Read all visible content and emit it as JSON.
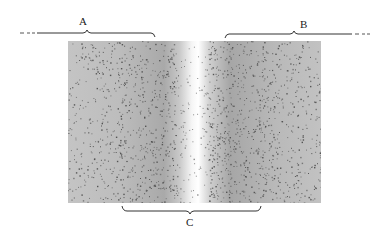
{
  "figure": {
    "labels": {
      "a": "A",
      "b": "B",
      "c": "C"
    },
    "regions": [
      {
        "id": "a",
        "label": "A",
        "description": "left region (dashed extension to the left)"
      },
      {
        "id": "b",
        "label": "B",
        "description": "right region (dashed extension to the right)"
      },
      {
        "id": "c",
        "label": "C",
        "description": "central region spanning the bright band"
      }
    ],
    "colors": {
      "background_fill": "#b4b4b4",
      "speckle": "#555555",
      "band": "#ffffff",
      "line": "#333333"
    }
  }
}
